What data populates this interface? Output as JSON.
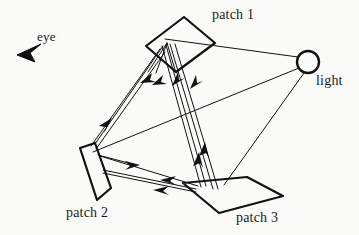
{
  "figure": {
    "background_color": "#fbfbfa",
    "ink_color": "#111111",
    "labels": {
      "patch1": "patch 1",
      "patch2": "patch 2",
      "patch3": "patch 3",
      "eye": "eye",
      "light": "light"
    },
    "elements": {
      "eye_icon": "eye-wedge-icon",
      "light_icon": "light-source-circle-icon",
      "patch1_icon": "patch-quadrilateral-icon",
      "patch2_icon": "patch-quadrilateral-icon",
      "patch3_icon": "patch-parallelogram-icon"
    },
    "geometry": {
      "patch1_polygon": "146,46 184,17 215,43 176,72",
      "patch2_polygon": "80,148 95,143 111,188 97,200",
      "patch3_polygon": "183,183 247,177 283,196 219,213",
      "light_circle": {
        "cx": 308,
        "cy": 62,
        "r": 11
      },
      "eye_wedge": "18,54 40,45 28,52 34,60"
    },
    "rays": [
      {
        "name": "light-to-patch1",
        "from": "light",
        "to": "patch 1"
      },
      {
        "name": "light-to-patch2",
        "from": "light",
        "to": "patch 2"
      },
      {
        "name": "light-to-patch3",
        "from": "light",
        "to": "patch 3"
      },
      {
        "name": "patch1-to-patch2",
        "from": "patch 1",
        "to": "patch 2"
      },
      {
        "name": "patch1-to-patch3",
        "from": "patch 1",
        "to": "patch 3"
      },
      {
        "name": "patch2-to-patch1",
        "from": "patch 2",
        "to": "patch 1"
      },
      {
        "name": "patch2-to-patch3",
        "from": "patch 2",
        "to": "patch 3"
      },
      {
        "name": "patch3-to-patch1",
        "from": "patch 3",
        "to": "patch 1"
      },
      {
        "name": "patch3-to-patch2",
        "from": "patch 3",
        "to": "patch 2"
      }
    ],
    "arrow_count": 11
  }
}
